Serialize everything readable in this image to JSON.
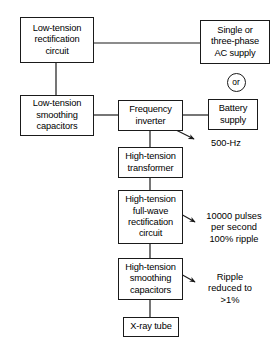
{
  "diagram": {
    "line_color": "#1a1a1a",
    "background_color": "#ffffff",
    "nodes": [
      {
        "id": "low-tension-rectification",
        "label": "Low-tension\nrectification\ncircuit",
        "x": 20,
        "y": 17,
        "w": 74,
        "h": 46
      },
      {
        "id": "ac-supply",
        "label": "Single or\nthree-phase\nAC supply",
        "x": 200,
        "y": 20,
        "w": 70,
        "h": 44
      },
      {
        "id": "low-tension-smoothing",
        "label": "Low-tension\nsmoothing\ncapacitors",
        "x": 20,
        "y": 95,
        "w": 74,
        "h": 41
      },
      {
        "id": "frequency-inverter",
        "label": "Frequency\ninverter",
        "x": 118,
        "y": 100,
        "w": 65,
        "h": 31
      },
      {
        "id": "battery-supply",
        "label": "Battery\nsupply",
        "x": 208,
        "y": 99,
        "w": 50,
        "h": 31
      },
      {
        "id": "high-tension-transformer",
        "label": "High-tension\ntransformer",
        "x": 118,
        "y": 147,
        "w": 65,
        "h": 31
      },
      {
        "id": "high-tension-rectification",
        "label": "High-tension\nfull-wave\nrectification\ncircuit",
        "x": 118,
        "y": 190,
        "w": 65,
        "h": 54
      },
      {
        "id": "high-tension-smoothing",
        "label": "High-tension\nsmoothing\ncapacitors",
        "x": 118,
        "y": 258,
        "w": 65,
        "h": 42
      },
      {
        "id": "x-ray-tube",
        "label": "X-ray tube",
        "x": 123,
        "y": 317,
        "w": 56,
        "h": 20
      }
    ],
    "or_badge": {
      "id": "or-badge",
      "label": "or",
      "cx": 236,
      "cy": 82,
      "r": 9.5
    },
    "annotations": [
      {
        "id": "frequency-annotation",
        "text": "500-Hz",
        "x": 198,
        "y": 138,
        "w": 56
      },
      {
        "id": "pulses-annotation",
        "text": "10000 pulses\nper second\n100% ripple",
        "x": 192,
        "y": 211,
        "w": 84
      },
      {
        "id": "ripple-annotation",
        "text": "Ripple\nreduced to\n>1%",
        "x": 194,
        "y": 272,
        "w": 72
      }
    ],
    "connectors": [
      {
        "id": "rectification-to-ac-supply",
        "type": "line",
        "points": "94,43 200,43"
      },
      {
        "id": "rectification-to-smoothing",
        "type": "line",
        "points": "56,63 56,95"
      },
      {
        "id": "smoothing-to-inverter",
        "type": "line",
        "points": "94,115 118,115"
      },
      {
        "id": "inverter-to-battery",
        "type": "line",
        "points": "183,115 208,115"
      },
      {
        "id": "inverter-to-transformer",
        "type": "line",
        "points": "150,131 150,147"
      },
      {
        "id": "transformer-to-rectification",
        "type": "line",
        "points": "150,178 150,190"
      },
      {
        "id": "rectification-to-ht-smoothing",
        "type": "line",
        "points": "150,244 150,258"
      },
      {
        "id": "ht-smoothing-to-tube",
        "type": "line",
        "points": "150,300 150,317"
      }
    ],
    "arrows": [
      {
        "id": "arrow-500hz",
        "from": "176,130",
        "to": "196,140"
      },
      {
        "id": "arrow-pulses",
        "from": "178,212",
        "to": "196,222"
      },
      {
        "id": "arrow-ripple",
        "from": "178,272",
        "to": "196,282"
      }
    ]
  }
}
